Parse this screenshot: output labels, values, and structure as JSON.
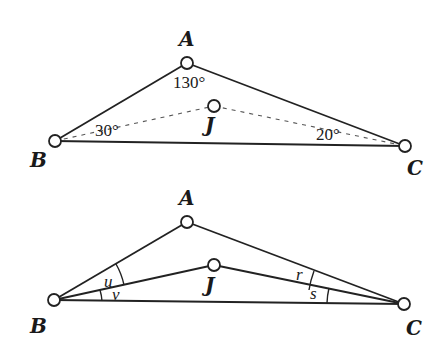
{
  "figure_top": {
    "vertices": {
      "A": {
        "label": "A",
        "x": 187,
        "y": 63
      },
      "B": {
        "label": "B",
        "x": 55,
        "y": 141
      },
      "C": {
        "label": "C",
        "x": 405,
        "y": 146
      },
      "J": {
        "label": "J",
        "x": 214,
        "y": 106
      }
    },
    "angle_labels": {
      "A": "130°",
      "B": "30°",
      "C": "20°"
    }
  },
  "figure_bottom": {
    "vertices": {
      "A": {
        "label": "A",
        "x": 187,
        "y": 222
      },
      "B": {
        "label": "B",
        "x": 54,
        "y": 300
      },
      "C": {
        "label": "C",
        "x": 404,
        "y": 304
      },
      "J": {
        "label": "J",
        "x": 214,
        "y": 265
      }
    },
    "angle_labels": {
      "u": "u",
      "v": "v",
      "r": "r",
      "s": "s"
    }
  },
  "colors": {
    "stroke": "#222222",
    "background": "#ffffff"
  }
}
